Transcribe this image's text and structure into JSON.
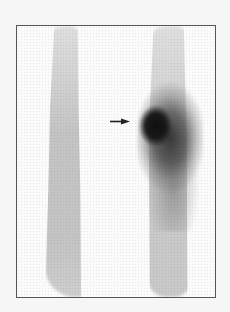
{
  "image": {
    "type": "scintigraphy-scan",
    "description": "Grayscale nuclear medicine scan showing two vertical bone columns; focal intense uptake in right column indicated by arrow",
    "colors": {
      "background": "#f6f6f6",
      "frame_border": "#555555",
      "uptake_core": "#0f0f0f",
      "bone_background": "#9a9a9a"
    },
    "annotations": [
      {
        "kind": "arrow",
        "direction": "right",
        "points_to": "focal-uptake"
      }
    ]
  }
}
